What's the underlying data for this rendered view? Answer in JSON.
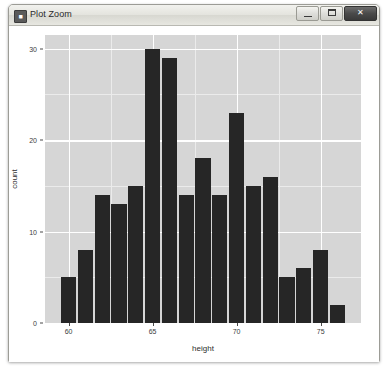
{
  "window": {
    "title": "Plot Zoom",
    "icon": "plot-window-icon",
    "controls": [
      {
        "name": "minimize",
        "label": "–"
      },
      {
        "name": "maximize",
        "label": "□"
      },
      {
        "name": "close",
        "label": "✕"
      }
    ]
  },
  "chart_data": {
    "type": "bar",
    "title": "",
    "subtitle": "",
    "xlabel": "height",
    "ylabel": "count",
    "grid": true,
    "legend": null,
    "xlim": [
      58.6,
      77.4
    ],
    "ylim": [
      0,
      31.5
    ],
    "x_ticks": [
      60,
      65,
      70,
      75
    ],
    "x_tick_labels": [
      "60",
      "65",
      "70",
      "75"
    ],
    "y_ticks": [
      0,
      10,
      20,
      30
    ],
    "y_tick_labels": [
      "0",
      "10",
      "20",
      "30"
    ],
    "y_minor_ticks": [
      5,
      15,
      25
    ],
    "x_minor_ticks": [
      62.5,
      67.5,
      72.5
    ],
    "bar_color": "#262626",
    "panel_color": "#d6d6d6",
    "gridline_color": "#ffffff",
    "bin_width": 1,
    "x": [
      60,
      61,
      62,
      63,
      64,
      65,
      66,
      67,
      68,
      69,
      70,
      71,
      72,
      73,
      74,
      75,
      76
    ],
    "categories": [
      "60",
      "61",
      "62",
      "63",
      "64",
      "65",
      "66",
      "67",
      "68",
      "69",
      "70",
      "71",
      "72",
      "73",
      "74",
      "75",
      "76"
    ],
    "values": [
      5,
      8,
      14,
      13,
      15,
      30,
      29,
      14,
      18,
      14,
      23,
      15,
      16,
      5,
      6,
      8,
      2
    ]
  }
}
